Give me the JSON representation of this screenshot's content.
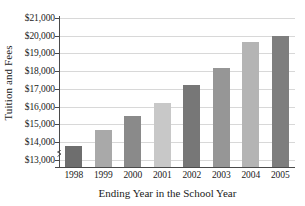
{
  "chart_data": {
    "type": "bar",
    "title": "",
    "xlabel": "Ending Year in the School Year",
    "ylabel": "Tuition and Fees",
    "categories": [
      "1998",
      "1999",
      "2000",
      "2001",
      "2002",
      "2003",
      "2004",
      "2005"
    ],
    "values": [
      13800,
      14700,
      15500,
      16200,
      17200,
      18200,
      19650,
      20000
    ],
    "ylim": [
      12600,
      21000
    ],
    "yticks": [
      13000,
      14000,
      15000,
      16000,
      17000,
      18000,
      19000,
      20000,
      21000
    ],
    "ytick_labels": [
      "$13,000",
      "$14,000",
      "$15,000",
      "$16,000",
      "$17,000",
      "$18,000",
      "$19,000",
      "$20,000",
      "$21,000"
    ],
    "grid": true,
    "legend": "none",
    "axis_break": true,
    "bar_colors": [
      "#6e6e6e",
      "#a9a9a9",
      "#8a8a8a",
      "#c8c8c8",
      "#777777",
      "#969696",
      "#b4b4b4",
      "#7e7e7e"
    ],
    "grid_color": "#d8d8d8",
    "axis_color": "#4a4a4a"
  }
}
